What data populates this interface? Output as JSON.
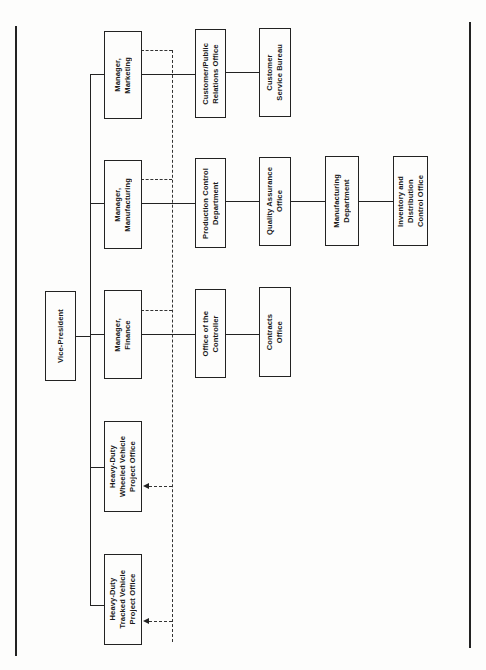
{
  "diagram": {
    "type": "organization-chart",
    "orientation": "rotated-90-ccw",
    "root": {
      "id": "vp",
      "label": "Vice-President"
    },
    "managers": [
      {
        "id": "mkt",
        "label": "Manager,\nMarketing"
      },
      {
        "id": "mfg",
        "label": "Manager,\nManufacturing"
      },
      {
        "id": "fin",
        "label": "Manager,\nFinance"
      },
      {
        "id": "wheeled",
        "label": "Heavy-Duty\nWheeled Vehicle\nProject Office"
      },
      {
        "id": "tracked",
        "label": "Heavy-Duty\nTracked Vehicle\nProject Office"
      }
    ],
    "units": [
      {
        "id": "cpr",
        "label": "Customer/Public\nRelations Office"
      },
      {
        "id": "csb",
        "label": "Customer\nService Bureau"
      },
      {
        "id": "pcd",
        "label": "Production Control\nDepartment"
      },
      {
        "id": "qao",
        "label": "Quality Assurance\nOffice"
      },
      {
        "id": "md",
        "label": "Manufacturing\nDepartment"
      },
      {
        "id": "idco",
        "label": "Inventory and\nDistribution\nControl Office"
      },
      {
        "id": "otc",
        "label": "Office of the\nController"
      },
      {
        "id": "co",
        "label": "Contracts\nOffice"
      }
    ],
    "edges_solid": [
      [
        "vp",
        "mkt"
      ],
      [
        "vp",
        "mfg"
      ],
      [
        "vp",
        "fin"
      ],
      [
        "vp",
        "wheeled"
      ],
      [
        "vp",
        "tracked"
      ],
      [
        "mkt",
        "cpr"
      ],
      [
        "cpr",
        "csb"
      ],
      [
        "mfg",
        "pcd"
      ],
      [
        "pcd",
        "qao"
      ],
      [
        "qao",
        "md"
      ],
      [
        "md",
        "idco"
      ],
      [
        "fin",
        "otc"
      ],
      [
        "otc",
        "co"
      ]
    ],
    "edges_dashed": [
      [
        "mkt",
        "wheeled"
      ],
      [
        "mkt",
        "tracked"
      ],
      [
        "mfg",
        "wheeled"
      ],
      [
        "mfg",
        "tracked"
      ],
      [
        "fin",
        "wheeled"
      ],
      [
        "fin",
        "tracked"
      ]
    ]
  },
  "labels": {
    "vp": "Vice-President",
    "mkt": "Manager,\nMarketing",
    "mfg": "Manager,\nManufacturing",
    "fin": "Manager,\nFinance",
    "wheeled": "Heavy-Duty\nWheeled Vehicle\nProject Office",
    "tracked": "Heavy-Duty\nTracked Vehicle\nProject Office",
    "cpr": "Customer/Public\nRelations Office",
    "csb": "Customer\nService Bureau",
    "pcd": "Production Control\nDepartment",
    "qao": "Quality Assurance\nOffice",
    "md": "Manufacturing\nDepartment",
    "idco": "Inventory and\nDistribution\nControl Office",
    "otc": "Office of the\nController",
    "co": "Contracts\nOffice"
  }
}
